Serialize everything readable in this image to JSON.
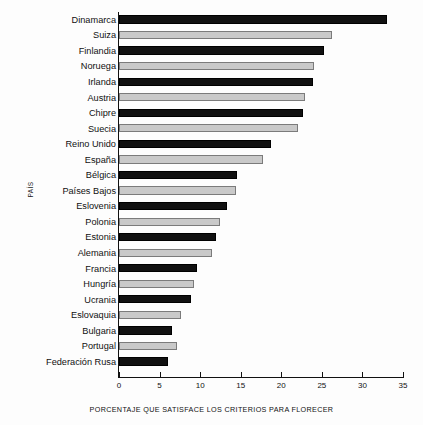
{
  "chart_data": {
    "type": "bar",
    "orientation": "horizontal",
    "title": "",
    "xlabel": "PORCENTAJE QUE SATISFACE LOS CRITERIOS PARA FLORECER",
    "ylabel": "PAÍS",
    "xlim": [
      0,
      35
    ],
    "xticks": [
      "0",
      "5",
      "10",
      "15",
      "20",
      "25",
      "30",
      "35"
    ],
    "grid": false,
    "legend": null,
    "categories": [
      "Dinamarca",
      "Suiza",
      "Finlandia",
      "Noruega",
      "Irlanda",
      "Austria",
      "Chipre",
      "Suecia",
      "Reino Unido",
      "España",
      "Bélgica",
      "Países Bajos",
      "Eslovenia",
      "Polonia",
      "Estonia",
      "Alemania",
      "Francia",
      "Hungría",
      "Ucrania",
      "Eslovaquia",
      "Bulgaria",
      "Portugal",
      "Federación Rusa"
    ],
    "values": [
      33.0,
      26.3,
      25.3,
      24.0,
      23.9,
      22.9,
      22.7,
      22.0,
      18.7,
      17.8,
      14.6,
      14.4,
      13.3,
      12.4,
      12.0,
      11.4,
      9.6,
      9.2,
      8.9,
      7.6,
      6.5,
      7.1,
      6.0
    ],
    "bar_styles": [
      "dark",
      "light",
      "dark",
      "light",
      "dark",
      "light",
      "dark",
      "light",
      "dark",
      "light",
      "dark",
      "light",
      "dark",
      "light",
      "dark",
      "light",
      "dark",
      "light",
      "dark",
      "light",
      "dark",
      "light",
      "dark"
    ],
    "colors": {
      "dark_bar": "#111111",
      "light_bar_fill": "#c9c9c9",
      "light_bar_border": "#7b7b7b",
      "axis": "#111111",
      "background": "#fdfdfd"
    }
  }
}
